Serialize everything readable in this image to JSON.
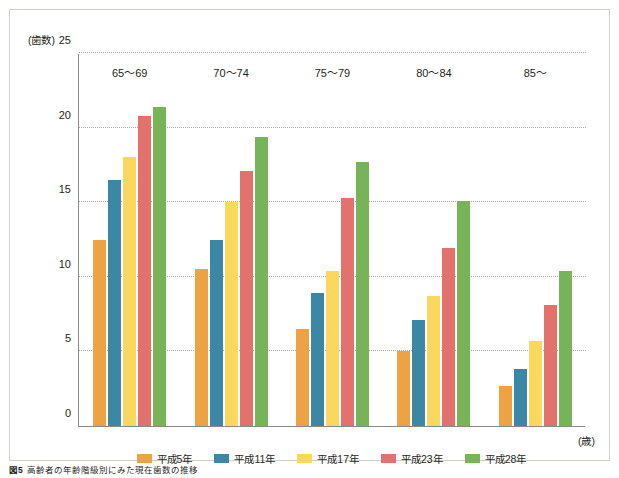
{
  "figure": {
    "caption_number": "図5",
    "caption_text": "高齢者の年齢階級別にみた現在歯数の推移"
  },
  "axes": {
    "y_unit_label": "(歯数)",
    "x_unit_label": "(歳)",
    "y_ticks": [
      "0",
      "5",
      "10",
      "15",
      "20",
      "25"
    ]
  },
  "colors": {
    "heisei5": "#EDA244",
    "heisei11": "#3D87A6",
    "heisei17": "#FAD85E",
    "heisei23": "#E3726E",
    "heisei28": "#76B457",
    "axis": "#8B8B85",
    "grid": "#A9A9A2",
    "border": "#CFCFC7"
  },
  "legend": {
    "position": "bottom-center",
    "items": [
      {
        "label": "平成5年",
        "color": "#EDA244"
      },
      {
        "label": "平成11年",
        "color": "#3D87A6"
      },
      {
        "label": "平成17年",
        "color": "#FAD85E"
      },
      {
        "label": "平成23年",
        "color": "#E3726E"
      },
      {
        "label": "平成28年",
        "color": "#76B457"
      }
    ]
  },
  "chart_data": {
    "type": "bar",
    "title": "高齢者の年齢階級別にみた現在歯数の推移",
    "xlabel": "(歳)",
    "ylabel": "(歯数)",
    "ylim": [
      0,
      25
    ],
    "yticks": [
      0,
      5,
      10,
      15,
      20,
      25
    ],
    "grid": true,
    "legend_position": "bottom-center",
    "categories": [
      "65〜69",
      "70〜74",
      "75〜79",
      "80〜84",
      "85〜"
    ],
    "series": [
      {
        "name": "平成5年",
        "color": "#EDA244",
        "values": [
          12.5,
          10.5,
          6.5,
          5.0,
          2.7
        ]
      },
      {
        "name": "平成11年",
        "color": "#3D87A6",
        "values": [
          16.5,
          12.5,
          8.9,
          7.1,
          3.8
        ]
      },
      {
        "name": "平成17年",
        "color": "#FAD85E",
        "values": [
          18.0,
          15.0,
          10.4,
          8.7,
          5.7
        ]
      },
      {
        "name": "平成23年",
        "color": "#E3726E",
        "values": [
          20.8,
          17.1,
          15.3,
          11.9,
          8.1
        ]
      },
      {
        "name": "平成28年",
        "color": "#76B457",
        "values": [
          21.4,
          19.4,
          17.7,
          15.1,
          10.4
        ]
      }
    ]
  }
}
